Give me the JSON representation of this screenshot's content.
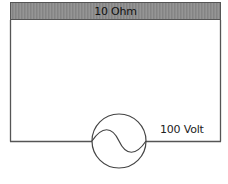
{
  "diagram": {
    "type": "circuit",
    "resistor": {
      "label": "10 Ohm"
    },
    "source": {
      "label": "100 Volt",
      "kind": "ac-voltage-source"
    },
    "colors": {
      "wire": "#555555",
      "resistor_fill": "#8c8c8c",
      "background": "#ffffff"
    }
  }
}
